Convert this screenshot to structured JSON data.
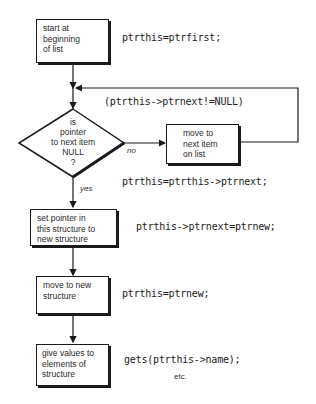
{
  "flowchart": {
    "steps": [
      {
        "id": "start",
        "text": "start at\nbeginning\nof list",
        "code": "ptrthis=ptrfirst;"
      },
      {
        "id": "decision",
        "text": "is\npointer\nto next item\nNULL\n?",
        "loop_condition": "(ptrthis->ptrnext!=NULL)"
      },
      {
        "id": "move-next",
        "text": "move to\nnext item\non list",
        "code": "ptrthis=ptrthis->ptrnext;"
      },
      {
        "id": "set-pointer",
        "text": "set pointer in\nthis structure to\nnew structure",
        "code": "ptrthis->ptrnext=ptrnew;"
      },
      {
        "id": "move-new",
        "text": "move to new\nstructure",
        "code": "ptrthis=ptrnew;"
      },
      {
        "id": "give-values",
        "text": "give values to\nelements of\nstructure",
        "code": "gets(ptrthis->name);",
        "note": "etc."
      }
    ],
    "branch_labels": {
      "no": "no",
      "yes": "yes"
    },
    "colors": {
      "line": "#1a1a1a",
      "background": "#ffffff"
    }
  }
}
